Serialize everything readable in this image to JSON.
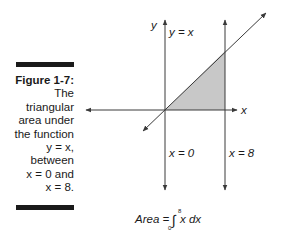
{
  "figure": {
    "label": "Figure 1-7:",
    "caption_lines": [
      "The",
      "triangular",
      "area under",
      "the function",
      "y = x,",
      "between",
      "x = 0 and",
      "x = 8."
    ]
  },
  "diagram": {
    "axis_x_label": "x",
    "axis_y_label": "y",
    "line_label": "y = x",
    "vline_left_label": "x = 0",
    "vline_right_label": "x = 8",
    "shade_color": "#c8c8c8",
    "stroke_color": "#3a3a3a"
  },
  "formula": {
    "prefix": "Area =",
    "upper_limit": "8",
    "lower_limit": "0",
    "integrand": "x dx",
    "integral_sign": "∫"
  }
}
